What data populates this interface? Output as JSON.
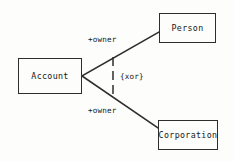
{
  "diagram": {
    "type": "uml-class-diagram",
    "notation": "UML",
    "background_color": "#fdfdfb",
    "line_color": "#2e2e2e",
    "text_color": "#171717",
    "classes": [
      {
        "id": "account",
        "name": "Account"
      },
      {
        "id": "person",
        "name": "Person"
      },
      {
        "id": "corporation",
        "name": "Corporation"
      }
    ],
    "associations": [
      {
        "id": "account-person",
        "from": "account",
        "to": "person",
        "style": "solid",
        "target_role": "+owner"
      },
      {
        "id": "account-corporation",
        "from": "account",
        "to": "corporation",
        "style": "solid",
        "target_role": "+owner"
      }
    ],
    "constraint": {
      "id": "xor-constraint",
      "label": "{xor}",
      "style": "dashed",
      "applies_to": [
        "account-person",
        "account-corporation"
      ]
    }
  }
}
